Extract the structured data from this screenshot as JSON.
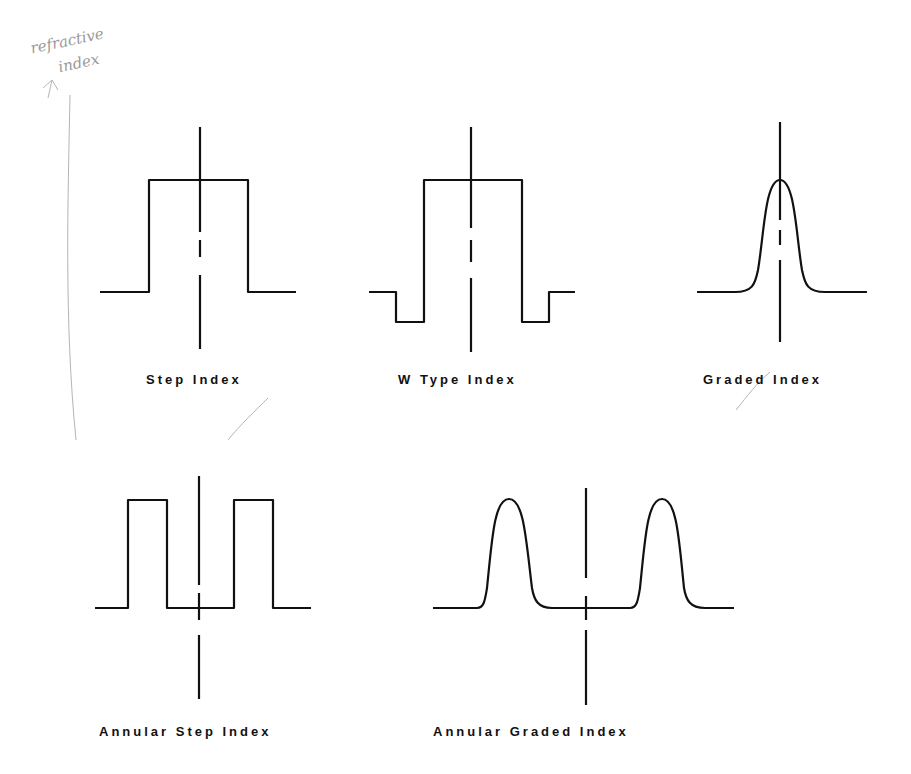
{
  "handwritten_note": {
    "line1": "refractive",
    "line2": "index"
  },
  "profiles": [
    {
      "id": "step",
      "label": "Step Index",
      "label_pos": [
        146,
        384
      ]
    },
    {
      "id": "w_type",
      "label": "W Type Index",
      "label_pos": [
        398,
        384
      ]
    },
    {
      "id": "graded",
      "label": "Graded Index",
      "label_pos": [
        703,
        384
      ]
    },
    {
      "id": "annular_step",
      "label": "Annular Step Index",
      "label_pos": [
        99,
        736
      ]
    },
    {
      "id": "annular_graded",
      "label": "Annular Graded Index",
      "label_pos": [
        433,
        736
      ]
    }
  ],
  "colors": {
    "ink": "#111111",
    "pencil": "#aaaaaa"
  }
}
